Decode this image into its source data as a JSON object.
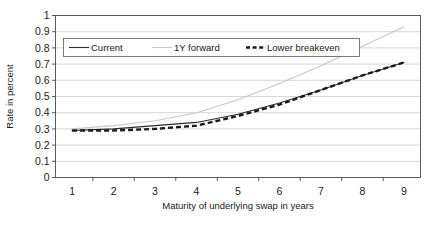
{
  "chart_data": {
    "type": "line",
    "title": "",
    "xlabel": "Maturity of underlying swap in years",
    "ylabel": "Rate in percent",
    "x": [
      1,
      2,
      3,
      4,
      5,
      6,
      7,
      8,
      9
    ],
    "xlim": [
      0.6,
      9.4
    ],
    "ylim": [
      0,
      1
    ],
    "ytick_labels": [
      "0",
      "0.1",
      "0.2",
      "0.3",
      "0.4",
      "0.5",
      "0.6",
      "0.7",
      "0.8",
      "0.9",
      "1"
    ],
    "ytick_values": [
      0,
      0.1,
      0.2,
      0.3,
      0.4,
      0.5,
      0.6,
      0.7,
      0.8,
      0.9,
      1
    ],
    "xtick_labels": [
      "1",
      "2",
      "3",
      "4",
      "5",
      "6",
      "7",
      "8",
      "9"
    ],
    "grid": "horizontal",
    "legend_position": "top-inside",
    "series": [
      {
        "name": "Current",
        "style": "solid",
        "color": "#2b2b2b",
        "values": [
          0.29,
          0.3,
          0.32,
          0.34,
          0.39,
          0.46,
          0.54,
          0.63,
          0.71
        ]
      },
      {
        "name": "1Y forward",
        "style": "solid",
        "color": "#c8c8c8",
        "values": [
          0.3,
          0.32,
          0.35,
          0.4,
          0.48,
          0.58,
          0.69,
          0.81,
          0.93
        ]
      },
      {
        "name": "Lower breakeven",
        "style": "dashed",
        "color": "#1a1a1a",
        "values": [
          0.29,
          0.29,
          0.3,
          0.32,
          0.38,
          0.45,
          0.54,
          0.63,
          0.71
        ]
      }
    ]
  },
  "legend": {
    "items": [
      {
        "label": "Current"
      },
      {
        "label": "1Y forward"
      },
      {
        "label": "Lower breakeven"
      }
    ]
  }
}
